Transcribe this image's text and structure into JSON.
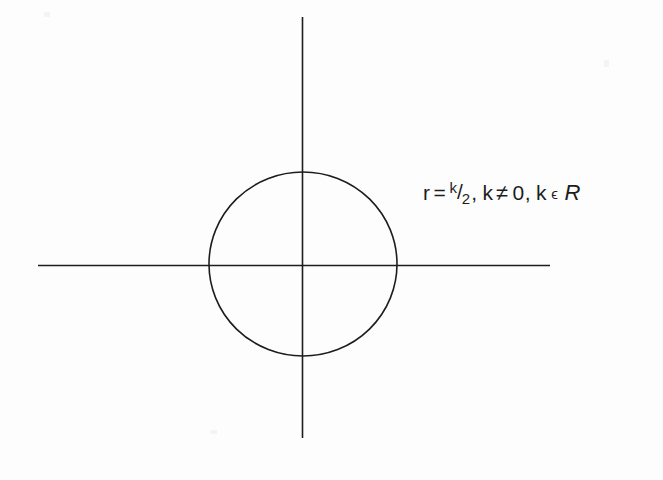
{
  "figure": {
    "background_color": "#fdfdfd",
    "stroke_color": "#1d1d1d",
    "text_color": "#1d1d1d",
    "width": 663,
    "height": 480
  },
  "annotation": {
    "variable": "r",
    "equals": "=",
    "fraction_numerator": "k",
    "fraction_slash": "/",
    "fraction_denominator": "2",
    "comma_1": ",",
    "param": "k",
    "not_equal": "≠",
    "zero": "0",
    "comma_2": ",",
    "param_2": "k",
    "element_of": "ϵ",
    "set_name": "R",
    "full_text": "r = k/2, k ≠ 0, k ϵ R"
  },
  "chart_data": {
    "type": "scatter",
    "title": "",
    "xlabel": "",
    "ylabel": "",
    "grid": false,
    "legend": null,
    "axes": {
      "x_axis": {
        "orientation": "horizontal",
        "x_start": 38,
        "x_end": 550,
        "y": 265,
        "ticks": [],
        "tick_labels": []
      },
      "y_axis": {
        "orientation": "vertical",
        "y_start": 17,
        "y_end": 438,
        "x": 302,
        "ticks": [],
        "tick_labels": []
      },
      "origin": [
        302,
        265
      ]
    },
    "shapes": [
      {
        "kind": "circle",
        "center_x": 303,
        "center_y": 264,
        "radius_x": 94,
        "radius_y": 92,
        "fill": "none",
        "stroke": "#1d1d1d",
        "stroke_width": 1.6,
        "label": "r = k/2",
        "description": "circle centered at origin passing through the four axis crossings"
      }
    ],
    "annotations": [
      {
        "text": "r = k/2, k ≠ 0, k ϵ R",
        "x": 424,
        "y": 207
      }
    ]
  }
}
